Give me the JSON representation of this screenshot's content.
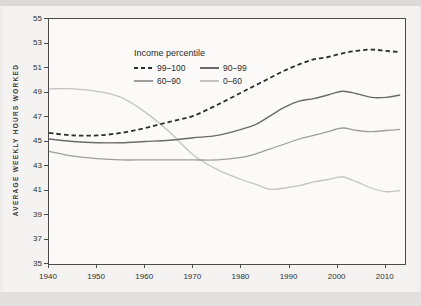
{
  "figure": {
    "background_color": "#efeeec",
    "plot_background_color": "#fbfaf8",
    "axis_color": "#4a4a4a",
    "text_color": "#2f2f2f"
  },
  "chart_data": {
    "type": "line",
    "title": "",
    "xlabel": "",
    "ylabel": "AVERAGE WEEKLY HOURS WORKED",
    "legend_title": "Income percentile",
    "legend_position": "top-left-inside",
    "grid": false,
    "xlim": [
      1940,
      2014
    ],
    "ylim": [
      35,
      55
    ],
    "x_ticks": [
      1940,
      1950,
      1960,
      1970,
      1980,
      1990,
      2000,
      2010
    ],
    "y_ticks": [
      35,
      37,
      39,
      41,
      43,
      45,
      47,
      49,
      51,
      53,
      55
    ],
    "x": [
      1940,
      1945,
      1950,
      1955,
      1960,
      1965,
      1970,
      1975,
      1980,
      1983,
      1986,
      1989,
      1992,
      1995,
      1998,
      2001,
      2004,
      2007,
      2010,
      2013
    ],
    "series": [
      {
        "name": "99–100",
        "style": "dashed",
        "color": "#2f2f2f",
        "stroke_width": 1.8,
        "values": [
          45.7,
          45.5,
          45.5,
          45.7,
          46.1,
          46.6,
          47.1,
          48.0,
          49.0,
          49.6,
          50.2,
          50.8,
          51.3,
          51.7,
          51.9,
          52.2,
          52.4,
          52.5,
          52.4,
          52.3
        ]
      },
      {
        "name": "90–99",
        "style": "solid",
        "color": "#6a6a6a",
        "stroke_width": 1.4,
        "values": [
          45.2,
          45.0,
          44.9,
          44.9,
          45.0,
          45.1,
          45.3,
          45.5,
          46.0,
          46.4,
          47.1,
          47.8,
          48.3,
          48.5,
          48.8,
          49.1,
          48.9,
          48.6,
          48.6,
          48.8
        ]
      },
      {
        "name": "60–90",
        "style": "solid",
        "color": "#9e9e9e",
        "stroke_width": 1.3,
        "values": [
          44.2,
          43.8,
          43.6,
          43.5,
          43.5,
          43.5,
          43.5,
          43.5,
          43.7,
          44.0,
          44.4,
          44.8,
          45.2,
          45.5,
          45.8,
          46.1,
          45.9,
          45.8,
          45.9,
          46.0
        ]
      },
      {
        "name": "0–60",
        "style": "solid",
        "color": "#c5c4c1",
        "stroke_width": 1.3,
        "values": [
          49.3,
          49.3,
          49.1,
          48.6,
          47.4,
          45.8,
          43.9,
          42.7,
          41.9,
          41.5,
          41.1,
          41.2,
          41.4,
          41.7,
          41.9,
          42.1,
          41.7,
          41.2,
          40.9,
          41.0
        ]
      }
    ]
  }
}
